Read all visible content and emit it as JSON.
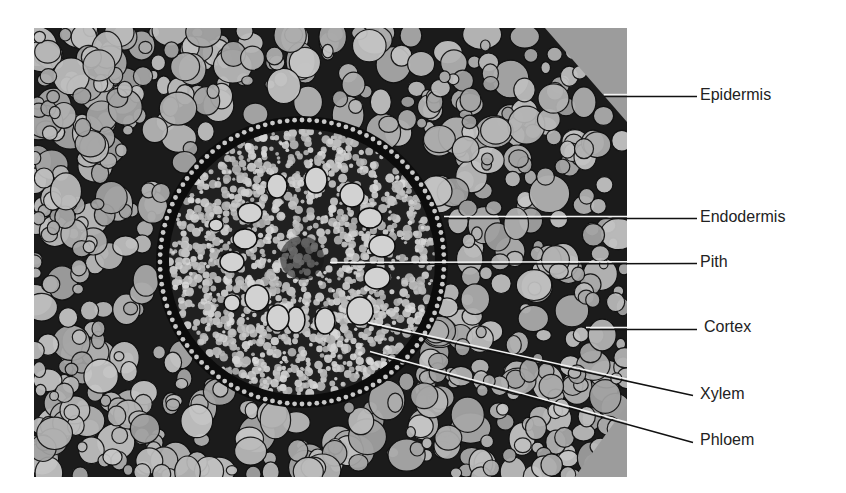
{
  "figure": {
    "image_box": {
      "x": 34,
      "y": 28,
      "width": 593,
      "height": 449
    },
    "colors": {
      "background": "#ffffff",
      "tissue_dark": "#1b1b1b",
      "cell_fill": "#b9b9b9",
      "cut_gray": "#9c9c9c",
      "leader_dark": "#111111",
      "leader_light": "#f2f2f2",
      "label_text": "#222222"
    },
    "stele": {
      "cx": 302,
      "cy": 262,
      "r": 133
    },
    "endodermis_ring": {
      "r": 142,
      "dot_count": 120
    },
    "xylem_vessels": [
      {
        "cx": 277,
        "cy": 186,
        "rx": 10,
        "ry": 12
      },
      {
        "cx": 316,
        "cy": 180,
        "rx": 11,
        "ry": 13
      },
      {
        "cx": 352,
        "cy": 195,
        "rx": 12,
        "ry": 12
      },
      {
        "cx": 370,
        "cy": 218,
        "rx": 12,
        "ry": 10
      },
      {
        "cx": 382,
        "cy": 246,
        "rx": 13,
        "ry": 11
      },
      {
        "cx": 377,
        "cy": 278,
        "rx": 13,
        "ry": 11
      },
      {
        "cx": 360,
        "cy": 311,
        "rx": 13,
        "ry": 14
      },
      {
        "cx": 325,
        "cy": 321,
        "rx": 10,
        "ry": 13
      },
      {
        "cx": 296,
        "cy": 320,
        "rx": 9,
        "ry": 13
      },
      {
        "cx": 278,
        "cy": 318,
        "rx": 11,
        "ry": 13
      },
      {
        "cx": 257,
        "cy": 298,
        "rx": 12,
        "ry": 13
      },
      {
        "cx": 232,
        "cy": 303,
        "rx": 8,
        "ry": 8
      },
      {
        "cx": 232,
        "cy": 262,
        "rx": 12,
        "ry": 10
      },
      {
        "cx": 245,
        "cy": 239,
        "rx": 12,
        "ry": 10
      },
      {
        "cx": 250,
        "cy": 213,
        "rx": 12,
        "ry": 10
      },
      {
        "cx": 216,
        "cy": 225,
        "rx": 7,
        "ry": 6
      }
    ],
    "seed": 7
  },
  "labels": [
    {
      "id": "epidermis",
      "text": "Epidermis",
      "x": 700,
      "y": 86,
      "line": {
        "x1": 604,
        "y1": 95,
        "x2": 697,
        "y2": 95
      }
    },
    {
      "id": "endodermis",
      "text": "Endodermis",
      "x": 700,
      "y": 208,
      "line": {
        "x1": 444,
        "y1": 217,
        "x2": 697,
        "y2": 217
      }
    },
    {
      "id": "pith",
      "text": "Pith",
      "x": 700,
      "y": 253,
      "line": {
        "x1": 330,
        "y1": 263,
        "x2": 697,
        "y2": 262
      }
    },
    {
      "id": "cortex",
      "text": "Cortex",
      "x": 704,
      "y": 318,
      "line": {
        "x1": 586,
        "y1": 328,
        "x2": 697,
        "y2": 328
      }
    },
    {
      "id": "xylem",
      "text": "Xylem",
      "x": 700,
      "y": 385,
      "line": {
        "x1": 368,
        "y1": 323,
        "x2": 693,
        "y2": 394
      }
    },
    {
      "id": "phloem",
      "text": "Phloem",
      "x": 700,
      "y": 431,
      "line": {
        "x1": 370,
        "y1": 352,
        "x2": 693,
        "y2": 441
      }
    }
  ]
}
